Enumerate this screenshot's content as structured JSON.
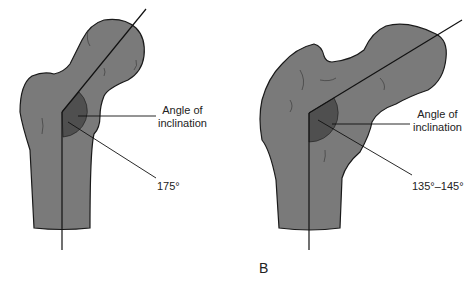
{
  "figure": {
    "panel_letter": "B",
    "bone_fill": "#7a7a7a",
    "angle_fill": "#4f4f4f",
    "outline": "#1a1a1a",
    "left": {
      "label_line1": "Angle of",
      "label_line2": "inclination",
      "angle_value": "175°"
    },
    "right": {
      "label_line1": "Angle of",
      "label_line2": "inclination",
      "angle_value": "135°–145°"
    }
  }
}
